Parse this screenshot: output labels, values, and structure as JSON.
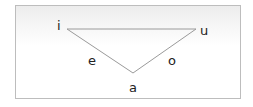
{
  "diagram": {
    "vertices": [
      {
        "label": "i",
        "position": "top-left"
      },
      {
        "label": "u",
        "position": "top-right"
      },
      {
        "label": "a",
        "position": "bottom"
      }
    ],
    "edge_labels": [
      {
        "label": "e",
        "between": [
          "i",
          "a"
        ]
      },
      {
        "label": "o",
        "between": [
          "u",
          "a"
        ]
      }
    ],
    "colors": {
      "line": "#9a9a9a",
      "border": "#bdbdbd",
      "text": "#222222"
    }
  }
}
